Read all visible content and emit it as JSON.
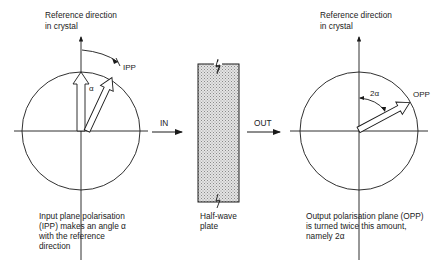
{
  "left_panel": {
    "reference_label_line1": "Reference direction",
    "reference_label_line2": "in crystal",
    "ipp_label": "IPP",
    "angle_label": "α",
    "caption_line1": "Input plane polarisation",
    "caption_line2": "(IPP) makes an angle α",
    "caption_line3": "with the reference",
    "caption_line4": "direction"
  },
  "middle": {
    "in_label": "IN",
    "out_label": "OUT",
    "plate_label_line1": "Half-wave",
    "plate_label_line2": "plate"
  },
  "right_panel": {
    "reference_label_line1": "Reference direction",
    "reference_label_line2": "in crystal",
    "opp_label": "OPP",
    "angle_label": "2α",
    "caption_line1": "Output polarisation plane (OPP)",
    "caption_line2": "is turned twice this amount,",
    "caption_line3": "namely 2α"
  },
  "colors": {
    "line": "#1a1a1a",
    "plate_fill": "#c8c8c8"
  }
}
